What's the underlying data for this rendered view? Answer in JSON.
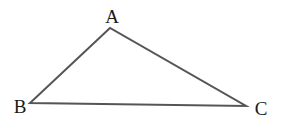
{
  "diagram": {
    "type": "triangle",
    "line_color": "#555555",
    "vertices": [
      {
        "label": "A",
        "x": 110,
        "y": 28,
        "label_x": 112,
        "label_y": 23
      },
      {
        "label": "B",
        "x": 30,
        "y": 103,
        "label_x": 20,
        "label_y": 113
      },
      {
        "label": "C",
        "x": 246,
        "y": 106,
        "label_x": 261,
        "label_y": 115
      }
    ],
    "edges": [
      [
        "A",
        "B"
      ],
      [
        "B",
        "C"
      ],
      [
        "C",
        "A"
      ]
    ]
  }
}
